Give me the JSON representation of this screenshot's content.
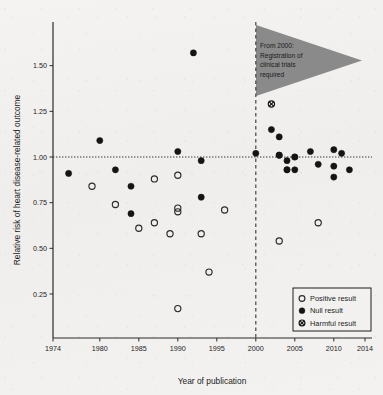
{
  "chart_data": {
    "type": "scatter",
    "title": "",
    "xlabel": "Year of publication",
    "ylabel": "Relative risk of heart disease-related outcome",
    "xlim": [
      1974,
      2014
    ],
    "ylim": [
      0.1,
      1.62
    ],
    "xticks": [
      1974,
      1980,
      1985,
      1990,
      1995,
      2000,
      2005,
      2010,
      2014
    ],
    "xtick_labels": [
      "1974",
      "1980",
      "1985",
      "1990",
      "1995",
      "2000",
      "2005",
      "2010",
      "2014"
    ],
    "yticks": [
      0.25,
      0.5,
      0.75,
      1.0,
      1.25,
      1.5
    ],
    "ytick_labels": [
      "0.25",
      "0.50",
      "0.75",
      "1.00",
      "1.25",
      "1.50"
    ],
    "grid": false,
    "reference_lines": [
      {
        "name": "null-effect-line",
        "orientation": "horizontal",
        "value": 1.0,
        "style": "dotted"
      },
      {
        "name": "year-2000-line",
        "orientation": "vertical",
        "value": 2000,
        "style": "dashed"
      }
    ],
    "annotation": {
      "name": "registration-annotation",
      "lines": [
        "From 2000:",
        "Registration of",
        "clinical trials",
        "required"
      ],
      "shape": "triangle",
      "color": "#8a8a8a"
    },
    "legend": {
      "position": "bottom-right",
      "entries": [
        {
          "label": "Positive result",
          "marker": "open-circle"
        },
        {
          "label": "Null result",
          "marker": "filled-circle"
        },
        {
          "label": "Harmful result",
          "marker": "cross-circle"
        }
      ]
    },
    "series": [
      {
        "name": "Positive result",
        "marker": "open-circle",
        "points": [
          {
            "x": 1979,
            "y": 0.84
          },
          {
            "x": 1982,
            "y": 0.74
          },
          {
            "x": 1985,
            "y": 0.61
          },
          {
            "x": 1987,
            "y": 0.88
          },
          {
            "x": 1987,
            "y": 0.64
          },
          {
            "x": 1989,
            "y": 0.58
          },
          {
            "x": 1990,
            "y": 0.72
          },
          {
            "x": 1990,
            "y": 0.7
          },
          {
            "x": 1990,
            "y": 0.9
          },
          {
            "x": 1990,
            "y": 0.17
          },
          {
            "x": 1993,
            "y": 0.58
          },
          {
            "x": 1994,
            "y": 0.37
          },
          {
            "x": 1996,
            "y": 0.71
          },
          {
            "x": 2003,
            "y": 0.54
          },
          {
            "x": 2008,
            "y": 0.64
          }
        ]
      },
      {
        "name": "Null result",
        "marker": "filled-circle",
        "points": [
          {
            "x": 1976,
            "y": 0.91
          },
          {
            "x": 1980,
            "y": 1.09
          },
          {
            "x": 1982,
            "y": 0.93
          },
          {
            "x": 1984,
            "y": 0.84
          },
          {
            "x": 1984,
            "y": 0.69
          },
          {
            "x": 1990,
            "y": 1.03
          },
          {
            "x": 1992,
            "y": 1.57
          },
          {
            "x": 1993,
            "y": 0.98
          },
          {
            "x": 1993,
            "y": 0.78
          },
          {
            "x": 2000,
            "y": 1.02
          },
          {
            "x": 2002,
            "y": 1.15
          },
          {
            "x": 2003,
            "y": 1.11
          },
          {
            "x": 2003,
            "y": 1.01
          },
          {
            "x": 2003,
            "y": 1.01
          },
          {
            "x": 2004,
            "y": 0.98
          },
          {
            "x": 2004,
            "y": 0.93
          },
          {
            "x": 2005,
            "y": 1.0
          },
          {
            "x": 2005,
            "y": 1.0
          },
          {
            "x": 2005,
            "y": 0.93
          },
          {
            "x": 2004,
            "y": 0.93
          },
          {
            "x": 2007,
            "y": 1.03
          },
          {
            "x": 2008,
            "y": 0.96
          },
          {
            "x": 2010,
            "y": 1.04
          },
          {
            "x": 2010,
            "y": 0.95
          },
          {
            "x": 2010,
            "y": 0.89
          },
          {
            "x": 2011,
            "y": 1.02
          },
          {
            "x": 2012,
            "y": 0.93
          }
        ]
      },
      {
        "name": "Harmful result",
        "marker": "cross-circle",
        "points": [
          {
            "x": 2002,
            "y": 1.29
          }
        ]
      }
    ]
  }
}
